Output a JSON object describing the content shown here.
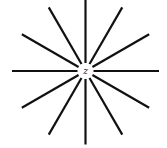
{
  "diagram": {
    "type": "radial-star",
    "center_label": "z",
    "ray_count": 12,
    "angle_step_deg": 30,
    "center": [
      85.5,
      71
    ],
    "inner_radius": 8,
    "outer_radius": 73.5,
    "stroke_color": "#111111",
    "stroke_width": 2.2
  }
}
